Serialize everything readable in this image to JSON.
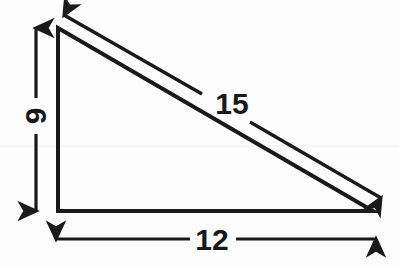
{
  "figure": {
    "name": "right-triangle-dimension-diagram",
    "background_color": "#fdfdfd",
    "stroke_color": "#1a1a1c",
    "text_color": "#18181a"
  },
  "triangle": {
    "vertices": {
      "apex": {
        "x": 58,
        "y": 28
      },
      "bottom_left": {
        "x": 58,
        "y": 211
      },
      "bottom_right": {
        "x": 373,
        "y": 211
      }
    },
    "stroke_width": 4
  },
  "labels": {
    "vertical_leg": {
      "value": "9",
      "rotation_deg": -90,
      "x": 35,
      "y": 116
    },
    "base": {
      "value": "12",
      "rotation_deg": 0,
      "x": 212,
      "y": 239
    },
    "hypotenuse": {
      "value": "15",
      "rotation_deg": 0,
      "x": 232,
      "y": 103
    }
  },
  "dimension_arrows": {
    "vertical": {
      "name": "vertical-dimension-arrow",
      "orientation": "vertical",
      "double_headed": true,
      "x": 36,
      "y_start": 28,
      "y_end": 211,
      "gap_start": 98,
      "gap_end": 134
    },
    "horizontal": {
      "name": "horizontal-dimension-arrow",
      "orientation": "horizontal",
      "double_headed": true,
      "y": 239,
      "x_start": 56,
      "x_end": 376,
      "gap_start": 190,
      "gap_end": 236
    },
    "diagonal": {
      "name": "hypotenuse-dimension-arrow",
      "orientation": "diagonal",
      "double_headed": true,
      "x_start": 64,
      "y_start": 15,
      "x_end": 381,
      "y_end": 198,
      "gap_start_x": 202,
      "gap_start_y": 94,
      "gap_end_x": 250,
      "gap_end_y": 122
    }
  },
  "chart_data": {
    "type": "diagram",
    "shape": "right triangle",
    "title": "",
    "measurements": [
      {
        "side": "vertical leg",
        "label": "9",
        "value": 9
      },
      {
        "side": "base",
        "label": "12",
        "value": 12
      },
      {
        "side": "hypotenuse",
        "label": "15",
        "value": 15
      }
    ]
  }
}
